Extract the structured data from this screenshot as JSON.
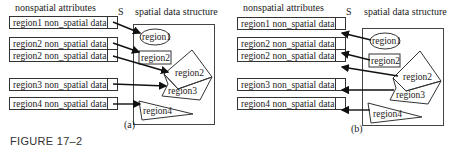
{
  "figure_label": "FIGURE 17–2",
  "panels": [
    {
      "id": "a",
      "caption": "(a)",
      "arrow_direction": "records-to-regions",
      "header_left": "nonspatial attributes",
      "header_s": "S",
      "header_right": "spatial data structure",
      "records": [
        {
          "label": "region1 non_spatial data"
        },
        {
          "label": "region2 non_spatial data"
        },
        {
          "label": "region2 non_spatial data"
        },
        {
          "label": "region3 non_spatial data"
        },
        {
          "label": "region4 non_spatial data"
        }
      ],
      "regions": [
        {
          "label": "region1",
          "shape": "ellipse"
        },
        {
          "label": "region2",
          "shape": "rectangle"
        },
        {
          "label": "region2",
          "shape": "polygon"
        },
        {
          "label": "region3",
          "shape": "polygon"
        },
        {
          "label": "region4",
          "shape": "triangle"
        }
      ]
    },
    {
      "id": "b",
      "caption": "(b)",
      "arrow_direction": "regions-to-records",
      "header_left": "nonspatial attributes",
      "header_s": "S",
      "header_right": "spatial data structure",
      "records": [
        {
          "label": "region1 non_spatial data"
        },
        {
          "label": "region2 non_spatial data"
        },
        {
          "label": "region2 non_spatial data"
        },
        {
          "label": "region3 non_spatial data"
        },
        {
          "label": "region4 non_spatial data"
        }
      ],
      "regions": [
        {
          "label": "region1",
          "shape": "ellipse"
        },
        {
          "label": "region2",
          "shape": "rectangle"
        },
        {
          "label": "region2",
          "shape": "polygon"
        },
        {
          "label": "region3",
          "shape": "polygon"
        },
        {
          "label": "region4",
          "shape": "triangle"
        }
      ]
    }
  ]
}
